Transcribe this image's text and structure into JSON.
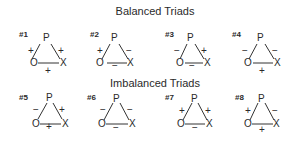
{
  "sections": [
    {
      "title": "Balanced Triads"
    },
    {
      "title": "Imbalanced Triads"
    }
  ],
  "node_labels": {
    "p": "P",
    "o": "O",
    "x": "X"
  },
  "triads": [
    {
      "id": "#1",
      "group": "balanced",
      "op": "+",
      "px": "+",
      "ox": "+"
    },
    {
      "id": "#2",
      "group": "balanced",
      "op": "+",
      "px": "−",
      "ox": "−"
    },
    {
      "id": "#3",
      "group": "balanced",
      "op": "−",
      "px": "+",
      "ox": "−"
    },
    {
      "id": "#4",
      "group": "balanced",
      "op": "−",
      "px": "−",
      "ox": "+"
    },
    {
      "id": "#5",
      "group": "imbalanced",
      "op": "−",
      "px": "+",
      "ox": "+"
    },
    {
      "id": "#6",
      "group": "imbalanced",
      "op": "−",
      "px": "−",
      "ox": "−"
    },
    {
      "id": "#7",
      "group": "imbalanced",
      "op": "+",
      "px": "+",
      "ox": "−"
    },
    {
      "id": "#8",
      "group": "imbalanced",
      "op": "+",
      "px": "−",
      "ox": "+"
    }
  ]
}
